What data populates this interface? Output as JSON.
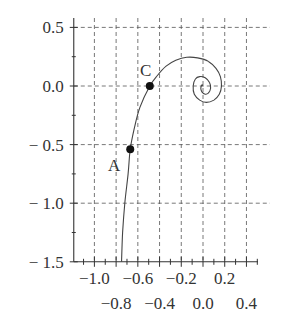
{
  "chart_data": {
    "type": "line",
    "title": "",
    "xlabel": "",
    "ylabel": "",
    "xlim": [
      -1.19,
      0.5
    ],
    "ylim": [
      -1.5,
      0.55
    ],
    "grid": true,
    "x_ticks_row1": [
      "-1.0",
      "-0.6",
      "-0.2",
      "0.2"
    ],
    "x_ticks_row2": [
      "-0.8",
      "-0.4",
      "0.0",
      "0.4"
    ],
    "x_tick_values": [
      -1.0,
      -0.8,
      -0.6,
      -0.4,
      -0.2,
      0.0,
      0.2,
      0.4
    ],
    "y_ticks": [
      "0.5",
      "0.0",
      "-0.5",
      "-1.0",
      "-1.5"
    ],
    "y_tick_values": [
      0.5,
      0.0,
      -0.5,
      -1.0,
      -1.5
    ],
    "series": [
      {
        "name": "spiral",
        "x": [
          -0.75,
          -0.74,
          -0.72,
          -0.69,
          -0.67,
          -0.63,
          -0.58,
          -0.49,
          -0.42,
          -0.34,
          -0.25,
          -0.15,
          -0.05,
          0.05,
          0.12,
          0.16,
          0.17,
          0.15,
          0.1,
          0.03,
          -0.03,
          -0.08,
          -0.09,
          -0.07,
          -0.03,
          0.02,
          0.06,
          0.07,
          0.05,
          0.02,
          -0.01,
          -0.02,
          -0.01,
          0.0
        ],
        "y": [
          -1.5,
          -1.25,
          -1.0,
          -0.75,
          -0.54,
          -0.35,
          -0.18,
          0.0,
          0.09,
          0.17,
          0.22,
          0.245,
          0.24,
          0.21,
          0.15,
          0.08,
          0.0,
          -0.07,
          -0.12,
          -0.14,
          -0.12,
          -0.07,
          0.0,
          0.06,
          0.08,
          0.07,
          0.03,
          -0.02,
          -0.06,
          -0.07,
          -0.05,
          -0.02,
          0.01,
          0.0
        ]
      }
    ],
    "points": [
      {
        "label": "A",
        "x": -0.67,
        "y": -0.54
      },
      {
        "label": "C",
        "x": -0.49,
        "y": 0.0
      }
    ]
  }
}
